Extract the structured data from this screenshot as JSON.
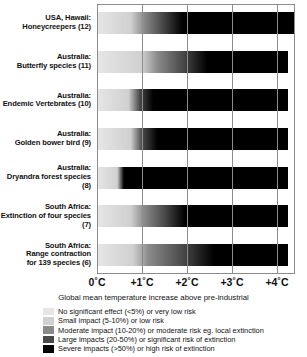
{
  "chart_data": {
    "type": "bar",
    "title": "",
    "xlabel": "Global mean temperature increase above pre-industrial",
    "ylabel": "",
    "xlim": [
      0,
      4.4
    ],
    "grid": true,
    "legend_position": "bottom",
    "x_ticks": [
      {
        "value": 0,
        "label": "0˚C"
      },
      {
        "value": 1,
        "label": "+1˚C"
      },
      {
        "value": 2,
        "label": "+2˚C"
      },
      {
        "value": 3,
        "label": "+3˚C"
      },
      {
        "value": 4,
        "label": "+4˚C"
      }
    ],
    "categories": [
      "USA, Hawaii: Honeycreepers (12)",
      "Australia: Butterfly species (11)",
      "Australia: Endemic Vertebrates (10)",
      "Australia: Golden bower bird (9)",
      "Australia: Dryandra forest species (8)",
      "South Africa: Extinction of four species (7)",
      "South Africa: Range contraction for 139 species (6)"
    ],
    "series": [
      {
        "name": "Honeycreepers (12)",
        "label_lines": [
          "USA, Hawaii:",
          "Honeycreepers (12)"
        ],
        "ref": 12,
        "bar_start_c": 0.0,
        "bar_end_c": 4.4,
        "severity_stops": [
          {
            "temp_c": 0.0,
            "level": 1
          },
          {
            "temp_c": 0.75,
            "level": 2
          },
          {
            "temp_c": 1.05,
            "level": 3
          },
          {
            "temp_c": 1.45,
            "level": 4
          },
          {
            "temp_c": 1.9,
            "level": 5
          },
          {
            "temp_c": 4.4,
            "level": 5
          }
        ]
      },
      {
        "name": "Butterfly species (11)",
        "label_lines": [
          "Australia:",
          "Butterfly species (11)"
        ],
        "ref": 11,
        "bar_start_c": 0.0,
        "bar_end_c": 4.25,
        "severity_stops": [
          {
            "temp_c": 0.0,
            "level": 1
          },
          {
            "temp_c": 1.0,
            "level": 2
          },
          {
            "temp_c": 1.35,
            "level": 3
          },
          {
            "temp_c": 1.9,
            "level": 4
          },
          {
            "temp_c": 2.45,
            "level": 5
          },
          {
            "temp_c": 4.25,
            "level": 5
          }
        ]
      },
      {
        "name": "Endemic Vertebrates (10)",
        "label_lines": [
          "Australia:",
          "Endemic Vertebrates (10)"
        ],
        "ref": 10,
        "bar_start_c": 0.0,
        "bar_end_c": 4.25,
        "severity_stops": [
          {
            "temp_c": 0.0,
            "level": 1
          },
          {
            "temp_c": 0.7,
            "level": 2
          },
          {
            "temp_c": 0.95,
            "level": 4
          },
          {
            "temp_c": 1.25,
            "level": 5
          },
          {
            "temp_c": 4.25,
            "level": 5
          }
        ]
      },
      {
        "name": "Golden bower bird (9)",
        "label_lines": [
          "Australia:",
          "Golden bower bird (9)"
        ],
        "ref": 9,
        "bar_start_c": 0.0,
        "bar_end_c": 4.25,
        "severity_stops": [
          {
            "temp_c": 0.0,
            "level": 1
          },
          {
            "temp_c": 0.75,
            "level": 2
          },
          {
            "temp_c": 1.0,
            "level": 4
          },
          {
            "temp_c": 1.35,
            "level": 5
          },
          {
            "temp_c": 4.25,
            "level": 5
          }
        ]
      },
      {
        "name": "Dryandra forest species (8)",
        "label_lines": [
          "Australia:",
          "Dryandra forest species (8)"
        ],
        "ref": 8,
        "bar_start_c": 0.0,
        "bar_end_c": 4.25,
        "severity_stops": [
          {
            "temp_c": 0.0,
            "level": 1
          },
          {
            "temp_c": 0.45,
            "level": 2
          },
          {
            "temp_c": 0.6,
            "level": 5
          },
          {
            "temp_c": 4.25,
            "level": 5
          }
        ]
      },
      {
        "name": "Extinction of four species (7)",
        "label_lines": [
          "South Africa:",
          "Extinction of four species (7)"
        ],
        "ref": 7,
        "bar_start_c": 0.0,
        "bar_end_c": 4.25,
        "severity_stops": [
          {
            "temp_c": 0.0,
            "level": 1
          },
          {
            "temp_c": 0.75,
            "level": 2
          },
          {
            "temp_c": 1.05,
            "level": 3
          },
          {
            "temp_c": 1.5,
            "level": 4
          },
          {
            "temp_c": 1.95,
            "level": 5
          },
          {
            "temp_c": 4.25,
            "level": 5
          }
        ]
      },
      {
        "name": "Range contraction for 139 species (6)",
        "label_lines": [
          "South Africa:",
          "Range contraction",
          "for 139 species (6)"
        ],
        "ref": 6,
        "bar_start_c": 0.0,
        "bar_end_c": 4.25,
        "severity_stops": [
          {
            "temp_c": 0.0,
            "level": 1
          },
          {
            "temp_c": 0.8,
            "level": 2
          },
          {
            "temp_c": 1.15,
            "level": 3
          },
          {
            "temp_c": 1.9,
            "level": 4
          },
          {
            "temp_c": 2.6,
            "level": 5
          },
          {
            "temp_c": 4.25,
            "level": 5
          }
        ]
      }
    ],
    "legend": [
      {
        "level": 1,
        "color": "#e6e6e6",
        "label": "No significant effect (<5%) or very low risk"
      },
      {
        "level": 2,
        "color": "#d0d0d0",
        "label": "Small impact (5-10%) or low risk"
      },
      {
        "level": 3,
        "color": "#8a8a8a",
        "label": "Moderate impact (10-20%) or moderate risk eg. local extinction"
      },
      {
        "level": 4,
        "color": "#4a4a4a",
        "label": "Large impacts (20-50%) or significant risk of extinction"
      },
      {
        "level": 5,
        "color": "#000000",
        "label": "Severe impacts (>50%) or high risk of extinction"
      }
    ],
    "severity_colors": {
      "1": "#e6e6e6",
      "2": "#d0d0d0",
      "3": "#8a8a8a",
      "4": "#4a4a4a",
      "5": "#000000"
    }
  }
}
